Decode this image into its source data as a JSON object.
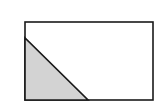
{
  "diagram": {
    "rectangle": {
      "x": 25,
      "y": 22,
      "width": 128,
      "height": 78,
      "stroke": "#1a1a1a",
      "fill": "#ffffff"
    },
    "triangle": {
      "points": "25,38 25,100 88,100",
      "fill": "#d3d3d3",
      "stroke": "#1a1a1a"
    }
  }
}
